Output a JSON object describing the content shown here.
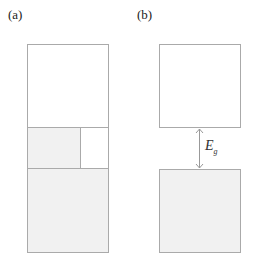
{
  "panels": [
    {
      "label": "(a)"
    },
    {
      "label": "(b)",
      "gap_label": "E",
      "gap_subscript": "g"
    }
  ],
  "colors": {
    "stroke": "#aaaaaa",
    "fill_filled": "#f1f1f1",
    "fill_empty": "#ffffff",
    "arrow": "#999999"
  }
}
